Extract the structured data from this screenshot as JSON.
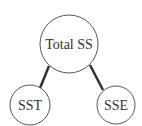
{
  "diagram": {
    "type": "tree",
    "root": {
      "label": "Total SS",
      "cx": 69,
      "cy": 44,
      "r": 29
    },
    "children": [
      {
        "label": "SST",
        "cx": 30,
        "cy": 105,
        "r": 20
      },
      {
        "label": "SSE",
        "cx": 116,
        "cy": 105,
        "r": 19
      }
    ],
    "colors": {
      "stroke": "#555555",
      "edge": "#333333",
      "text": "#333333"
    }
  }
}
